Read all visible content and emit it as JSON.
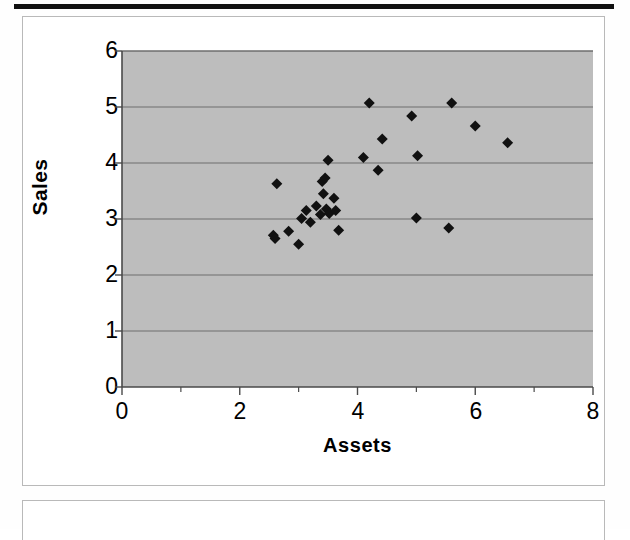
{
  "page": {
    "top_rule": "horizontal-rule",
    "figure_border": "#b9b9b9"
  },
  "chart_data": {
    "type": "scatter",
    "title": "",
    "xlabel": "Assets",
    "ylabel": "Sales",
    "xlim": [
      0,
      8
    ],
    "ylim": [
      0,
      6
    ],
    "xticks": [
      0,
      2,
      4,
      6,
      8
    ],
    "yticks": [
      0,
      1,
      2,
      3,
      4,
      5,
      6
    ],
    "xtick_labels": [
      "0",
      "2",
      "4",
      "6",
      "8"
    ],
    "ytick_labels": [
      "0",
      "1",
      "2",
      "3",
      "4",
      "5",
      "6"
    ],
    "x_minor_ticks": [
      1,
      3,
      5,
      7
    ],
    "grid": "horizontal",
    "grid_color": "#6e6e6e",
    "plot_background": "#bdbdbd",
    "marker": "diamond",
    "marker_color": "#111111",
    "marker_size": 11,
    "legend": "none",
    "n_points": 34,
    "points": [
      {
        "x": 2.57,
        "y": 2.71
      },
      {
        "x": 2.6,
        "y": 2.65
      },
      {
        "x": 2.63,
        "y": 3.63
      },
      {
        "x": 2.83,
        "y": 2.78
      },
      {
        "x": 3.0,
        "y": 2.55
      },
      {
        "x": 3.05,
        "y": 3.01
      },
      {
        "x": 3.13,
        "y": 3.15
      },
      {
        "x": 3.2,
        "y": 2.94
      },
      {
        "x": 3.3,
        "y": 3.23
      },
      {
        "x": 3.37,
        "y": 3.08
      },
      {
        "x": 3.4,
        "y": 3.67
      },
      {
        "x": 3.42,
        "y": 3.45
      },
      {
        "x": 3.45,
        "y": 3.73
      },
      {
        "x": 3.47,
        "y": 3.18
      },
      {
        "x": 3.5,
        "y": 4.05
      },
      {
        "x": 3.52,
        "y": 3.1
      },
      {
        "x": 3.6,
        "y": 3.37
      },
      {
        "x": 3.63,
        "y": 3.15
      },
      {
        "x": 3.68,
        "y": 2.8
      },
      {
        "x": 4.1,
        "y": 4.1
      },
      {
        "x": 4.2,
        "y": 5.07
      },
      {
        "x": 4.35,
        "y": 3.87
      },
      {
        "x": 4.42,
        "y": 4.43
      },
      {
        "x": 4.92,
        "y": 4.84
      },
      {
        "x": 5.0,
        "y": 3.02
      },
      {
        "x": 5.02,
        "y": 4.13
      },
      {
        "x": 5.55,
        "y": 2.84
      },
      {
        "x": 5.6,
        "y": 5.07
      },
      {
        "x": 6.0,
        "y": 4.66
      },
      {
        "x": 6.55,
        "y": 4.36
      }
    ]
  }
}
